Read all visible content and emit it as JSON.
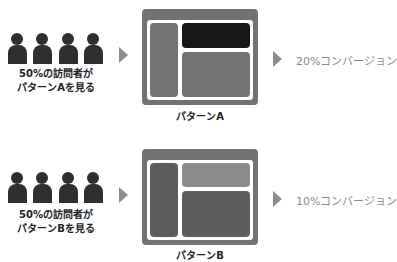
{
  "colors": {
    "person": "#2f2f2f",
    "arrow": "#8c8c8c",
    "window_frame": "#727272",
    "panel_gray": "#737373",
    "panel_highlight_a": "#161616",
    "panel_dark_b": "#5c5c5c",
    "panel_light_b": "#8c8c8c",
    "conversion_text": "#8a8a8a"
  },
  "rows": [
    {
      "visitors": {
        "count_icons": 4,
        "caption_line1": "50%の訪問者が",
        "caption_line2": "パターンAを見る"
      },
      "pattern": {
        "label": "パターンA",
        "highlight": "top-right-panel"
      },
      "result": {
        "label": "20%コンバージョン",
        "rate_percent": 20
      }
    },
    {
      "visitors": {
        "count_icons": 4,
        "caption_line1": "50%の訪問者が",
        "caption_line2": "パターンBを見る"
      },
      "pattern": {
        "label": "パターンB",
        "highlight": "none"
      },
      "result": {
        "label": "10%コンバージョン",
        "rate_percent": 10
      }
    }
  ]
}
